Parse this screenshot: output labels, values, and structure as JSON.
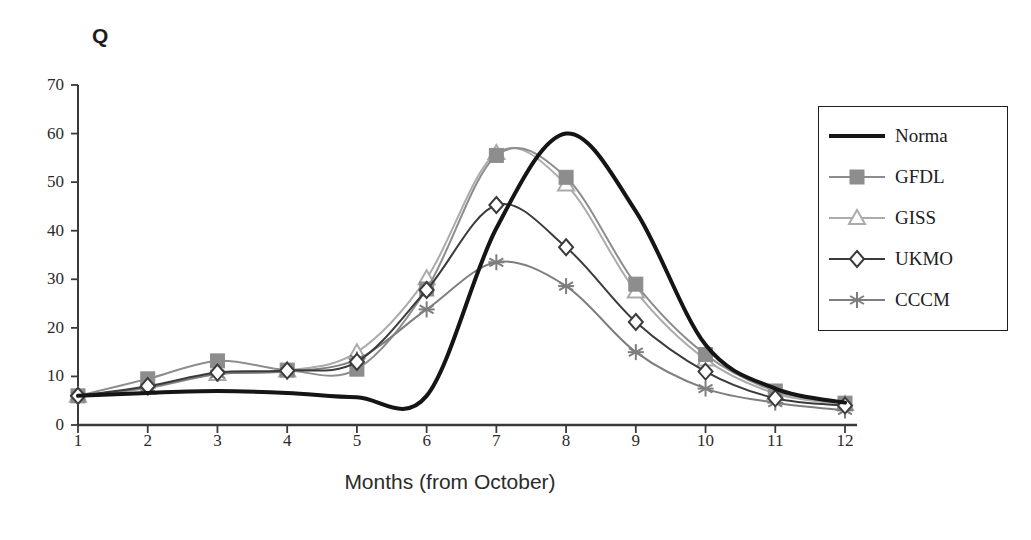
{
  "chart_data": {
    "type": "line",
    "title": "Q",
    "xlabel": "Months (from October)",
    "ylabel": "Q",
    "x": [
      1,
      2,
      3,
      4,
      5,
      6,
      7,
      8,
      9,
      10,
      11,
      12
    ],
    "xticklabels": [
      "1",
      "2",
      "3",
      "4",
      "5",
      "6",
      "7",
      "8",
      "9",
      "10",
      "11",
      "12"
    ],
    "yticks": [
      0,
      10,
      20,
      30,
      40,
      50,
      60,
      70
    ],
    "yticklabels": [
      "0",
      "10",
      "20",
      "30",
      "40",
      "50",
      "60",
      "70"
    ],
    "xlim": [
      1,
      12
    ],
    "ylim": [
      0,
      70
    ],
    "grid": false,
    "legend_position": "right",
    "series": [
      {
        "name": "Norma",
        "marker": "none",
        "color": "#151515",
        "linewidth": 4,
        "values": [
          6.0,
          6.6,
          7.0,
          6.6,
          5.7,
          6.0,
          40.5,
          60.0,
          44.0,
          16.5,
          7.5,
          4.6
        ]
      },
      {
        "name": "GFDL",
        "marker": "square-filled",
        "color": "#8d8d8d",
        "linewidth": 2,
        "values": [
          6.0,
          9.5,
          13.2,
          11.3,
          11.5,
          28.0,
          55.5,
          51.0,
          29.0,
          14.5,
          7.0,
          4.5
        ]
      },
      {
        "name": "GISS",
        "marker": "triangle-open",
        "color": "#ababab",
        "linewidth": 2,
        "values": [
          6.0,
          7.6,
          10.5,
          11.2,
          15.0,
          30.2,
          56.0,
          49.5,
          27.5,
          13.5,
          6.5,
          4.3
        ]
      },
      {
        "name": "UKMO",
        "marker": "diamond-open",
        "color": "#3b3b3b",
        "linewidth": 2,
        "values": [
          6.0,
          8.0,
          10.8,
          11.2,
          13.0,
          27.8,
          45.3,
          36.6,
          21.2,
          11.0,
          5.5,
          4.0
        ]
      },
      {
        "name": "CCCM",
        "marker": "asterisk",
        "color": "#7e7e7e",
        "linewidth": 2,
        "values": [
          6.0,
          7.7,
          10.5,
          11.0,
          13.5,
          23.8,
          33.5,
          28.6,
          15.0,
          7.5,
          4.6,
          3.0
        ]
      }
    ]
  },
  "legend": {
    "items": [
      {
        "label": "Norma"
      },
      {
        "label": "GFDL"
      },
      {
        "label": "GISS"
      },
      {
        "label": "UKMO"
      },
      {
        "label": "CCCM"
      }
    ]
  }
}
